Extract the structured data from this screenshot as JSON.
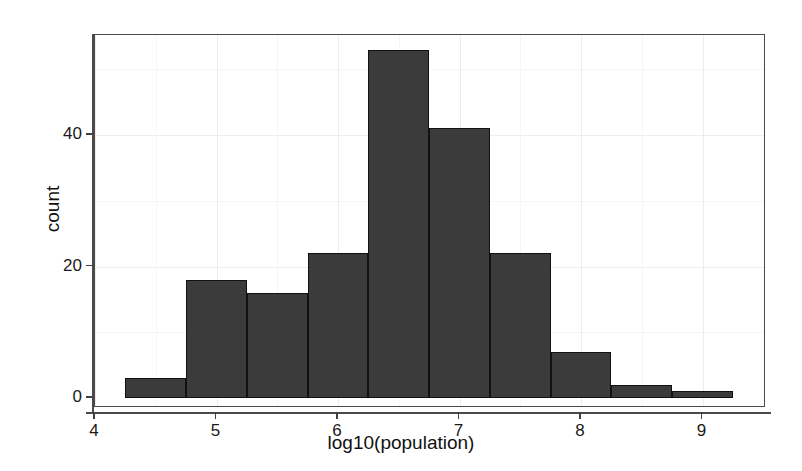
{
  "chart_data": {
    "type": "bar",
    "title": "",
    "subtitle": "",
    "xlabel": "log10(population)",
    "ylabel": "count",
    "xlim": [
      4.0,
      9.3
    ],
    "ylim": [
      0,
      55
    ],
    "grid": true,
    "legend": "none",
    "bin_width": 0.5,
    "bin_starts": [
      4.25,
      4.75,
      5.25,
      5.75,
      6.25,
      6.75,
      7.25,
      7.75,
      8.25,
      8.75
    ],
    "bin_centers": [
      4.5,
      5.0,
      5.5,
      6.0,
      6.5,
      7.0,
      7.5,
      8.0,
      8.5,
      9.0
    ],
    "categories": [
      "4.25-4.75",
      "4.75-5.25",
      "5.25-5.75",
      "5.75-6.25",
      "6.25-6.75",
      "6.75-7.25",
      "7.25-7.75",
      "7.75-8.25",
      "8.25-8.75",
      "8.75-9.25"
    ],
    "values": [
      3,
      18,
      16,
      22,
      53,
      41,
      22,
      7,
      2,
      1
    ],
    "x_ticks": [
      {
        "value": 4,
        "label": "4"
      },
      {
        "value": 5,
        "label": "5"
      },
      {
        "value": 6,
        "label": "6"
      },
      {
        "value": 7,
        "label": "7"
      },
      {
        "value": 8,
        "label": "8"
      },
      {
        "value": 9,
        "label": "9"
      }
    ],
    "y_ticks": [
      {
        "value": 0,
        "label": "0"
      },
      {
        "value": 20,
        "label": "20"
      },
      {
        "value": 40,
        "label": "40"
      }
    ],
    "y_minor_ticks": [
      10,
      30,
      50
    ],
    "x_minor_ticks": [
      4.5,
      5.5,
      6.5,
      7.5,
      8.5
    ],
    "colors": {
      "bar_fill": "#3b3b3b",
      "bar_border": "#111111",
      "panel_background": "#ffffff",
      "panel_border": "#4a4a4a",
      "grid_major": "#ededed",
      "grid_minor": "#f6f6f6",
      "text": "#1a1a1a"
    }
  }
}
